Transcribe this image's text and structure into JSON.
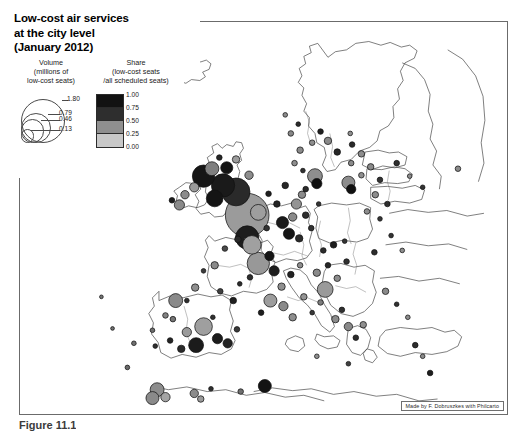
{
  "figure": {
    "caption": "Figure 11.1",
    "credit": "Made by F. Dobruszkes with Philcarto"
  },
  "title": {
    "line1": "Low-cost air services",
    "line2": "at the city level",
    "line3": "(January 2012)"
  },
  "legend": {
    "volume": {
      "head1": "Volume",
      "head2": "(millions of",
      "head3": "low-cost seats)",
      "values": [
        "1.80",
        "0.79",
        "0.46",
        "0.13"
      ]
    },
    "share": {
      "head1": "Share",
      "head2": "(low-cost seats",
      "head3": "/all scheduled seats)",
      "values": [
        "1.00",
        "0.75",
        "0.50",
        "0.25",
        "0.00"
      ],
      "colors": [
        "#121212",
        "#2e2e2e",
        "#8f8f8f",
        "#c8c8c8"
      ]
    }
  },
  "map": {
    "region": "Europe",
    "background": "#ffffff",
    "border_color": "#6b6b6b",
    "coastline_color": "#3a3a3a",
    "bubble_outline": "#111111",
    "bubbles": [
      {
        "x": 243,
        "y": 208,
        "r": 23.5,
        "fill": "#9b9b9b"
      },
      {
        "x": 231,
        "y": 183,
        "r": 15.0,
        "fill": "#2a2a2a"
      },
      {
        "x": 217,
        "y": 176,
        "r": 12.5,
        "fill": "#1a1a1a"
      },
      {
        "x": 208,
        "y": 190,
        "r": 9.0,
        "fill": "#141414"
      },
      {
        "x": 196,
        "y": 166,
        "r": 12.0,
        "fill": "#161616"
      },
      {
        "x": 205,
        "y": 158,
        "r": 7.5,
        "fill": "#7f7f7f"
      },
      {
        "x": 186,
        "y": 178,
        "r": 5.0,
        "fill": "#9a9a9a"
      },
      {
        "x": 176,
        "y": 186,
        "r": 4.5,
        "fill": "#8c8c8c"
      },
      {
        "x": 170,
        "y": 197,
        "r": 5.5,
        "fill": "#8a8a8a"
      },
      {
        "x": 162,
        "y": 192,
        "r": 3.0,
        "fill": "#1d1d1d"
      },
      {
        "x": 221,
        "y": 157,
        "r": 6.5,
        "fill": "#141414"
      },
      {
        "x": 231,
        "y": 148,
        "r": 4.0,
        "fill": "#9c9c9c"
      },
      {
        "x": 213,
        "y": 146,
        "r": 3.0,
        "fill": "#262626"
      },
      {
        "x": 245,
        "y": 165,
        "r": 4.5,
        "fill": "#8d8d8d"
      },
      {
        "x": 255,
        "y": 205,
        "r": 8.5,
        "fill": "#9e9e9e"
      },
      {
        "x": 243,
        "y": 232,
        "r": 12.5,
        "fill": "#1d1d1d"
      },
      {
        "x": 248,
        "y": 240,
        "r": 10.0,
        "fill": "#a0a0a0"
      },
      {
        "x": 233,
        "y": 234,
        "r": 3.5,
        "fill": "#2a2a2a"
      },
      {
        "x": 264,
        "y": 222,
        "r": 3.0,
        "fill": "#333333"
      },
      {
        "x": 219,
        "y": 244,
        "r": 3.0,
        "fill": "#4a4a4a"
      },
      {
        "x": 208,
        "y": 262,
        "r": 4.0,
        "fill": "#8b8b8b"
      },
      {
        "x": 196,
        "y": 268,
        "r": 2.5,
        "fill": "#3a3a3a"
      },
      {
        "x": 187,
        "y": 286,
        "r": 4.0,
        "fill": "#8f8f8f"
      },
      {
        "x": 178,
        "y": 300,
        "r": 2.5,
        "fill": "#2e2e2e"
      },
      {
        "x": 214,
        "y": 290,
        "r": 3.0,
        "fill": "#404040"
      },
      {
        "x": 228,
        "y": 300,
        "r": 3.5,
        "fill": "#1f1f1f"
      },
      {
        "x": 235,
        "y": 282,
        "r": 2.5,
        "fill": "#2b2b2b"
      },
      {
        "x": 206,
        "y": 318,
        "r": 2.5,
        "fill": "#303030"
      },
      {
        "x": 163,
        "y": 320,
        "r": 3.0,
        "fill": "#757575"
      },
      {
        "x": 141,
        "y": 332,
        "r": 2.5,
        "fill": "#6d6d6d"
      },
      {
        "x": 121,
        "y": 346,
        "r": 2.5,
        "fill": "#707070"
      },
      {
        "x": 166,
        "y": 300,
        "r": 7.5,
        "fill": "#8a8a8a"
      },
      {
        "x": 155,
        "y": 316,
        "r": 3.0,
        "fill": "#838383"
      },
      {
        "x": 178,
        "y": 334,
        "r": 5.0,
        "fill": "#9a9a9a"
      },
      {
        "x": 196,
        "y": 328,
        "r": 9.5,
        "fill": "#9f9f9f"
      },
      {
        "x": 188,
        "y": 348,
        "r": 8.0,
        "fill": "#1b1b1b"
      },
      {
        "x": 172,
        "y": 352,
        "r": 4.0,
        "fill": "#2a2a2a"
      },
      {
        "x": 160,
        "y": 343,
        "r": 3.0,
        "fill": "#242424"
      },
      {
        "x": 144,
        "y": 349,
        "r": 2.5,
        "fill": "#2e2e2e"
      },
      {
        "x": 211,
        "y": 341,
        "r": 5.5,
        "fill": "#1c1c1c"
      },
      {
        "x": 222,
        "y": 346,
        "r": 5.0,
        "fill": "#232323"
      },
      {
        "x": 232,
        "y": 331,
        "r": 3.0,
        "fill": "#3a3a3a"
      },
      {
        "x": 146,
        "y": 396,
        "r": 7.5,
        "fill": "#8d8d8d"
      },
      {
        "x": 141,
        "y": 405,
        "r": 7.0,
        "fill": "#8a8a8a"
      },
      {
        "x": 155,
        "y": 404,
        "r": 5.0,
        "fill": "#a4a4a4"
      },
      {
        "x": 186,
        "y": 400,
        "r": 4.5,
        "fill": "#8b8b8b"
      },
      {
        "x": 193,
        "y": 406,
        "r": 3.5,
        "fill": "#9a9a9a"
      },
      {
        "x": 204,
        "y": 395,
        "r": 2.5,
        "fill": "#2f2f2f"
      },
      {
        "x": 236,
        "y": 398,
        "r": 3.0,
        "fill": "#6f6f6f"
      },
      {
        "x": 262,
        "y": 392,
        "r": 7.0,
        "fill": "#131313"
      },
      {
        "x": 281,
        "y": 216,
        "r": 6.5,
        "fill": "#1a1a1a"
      },
      {
        "x": 292,
        "y": 210,
        "r": 4.5,
        "fill": "#8b8b8b"
      },
      {
        "x": 288,
        "y": 228,
        "r": 6.0,
        "fill": "#151515"
      },
      {
        "x": 299,
        "y": 233,
        "r": 4.0,
        "fill": "#2a2a2a"
      },
      {
        "x": 275,
        "y": 196,
        "r": 3.5,
        "fill": "#242424"
      },
      {
        "x": 296,
        "y": 196,
        "r": 5.5,
        "fill": "#949494"
      },
      {
        "x": 306,
        "y": 208,
        "r": 3.5,
        "fill": "#2e2e2e"
      },
      {
        "x": 312,
        "y": 222,
        "r": 3.0,
        "fill": "#313131"
      },
      {
        "x": 266,
        "y": 185,
        "r": 3.0,
        "fill": "#1f1f1f"
      },
      {
        "x": 284,
        "y": 176,
        "r": 3.5,
        "fill": "#272727"
      },
      {
        "x": 306,
        "y": 180,
        "r": 3.0,
        "fill": "#2c2c2c"
      },
      {
        "x": 320,
        "y": 196,
        "r": 2.5,
        "fill": "#343434"
      },
      {
        "x": 255,
        "y": 260,
        "r": 12.0,
        "fill": "#989898"
      },
      {
        "x": 267,
        "y": 252,
        "r": 5.0,
        "fill": "#151515"
      },
      {
        "x": 272,
        "y": 268,
        "r": 5.5,
        "fill": "#1e1e1e"
      },
      {
        "x": 246,
        "y": 275,
        "r": 3.0,
        "fill": "#2d2d2d"
      },
      {
        "x": 280,
        "y": 285,
        "r": 4.0,
        "fill": "#8f8f8f"
      },
      {
        "x": 290,
        "y": 272,
        "r": 3.5,
        "fill": "#222222"
      },
      {
        "x": 300,
        "y": 262,
        "r": 3.0,
        "fill": "#8d8d8d"
      },
      {
        "x": 268,
        "y": 300,
        "r": 7.0,
        "fill": "#9d9d9d"
      },
      {
        "x": 282,
        "y": 306,
        "r": 5.0,
        "fill": "#8b8b8b"
      },
      {
        "x": 258,
        "y": 313,
        "r": 3.0,
        "fill": "#1e1e1e"
      },
      {
        "x": 292,
        "y": 318,
        "r": 4.0,
        "fill": "#8e8e8e"
      },
      {
        "x": 304,
        "y": 296,
        "r": 3.5,
        "fill": "#949494"
      },
      {
        "x": 313,
        "y": 313,
        "r": 2.5,
        "fill": "#383838"
      },
      {
        "x": 322,
        "y": 302,
        "r": 3.0,
        "fill": "#7d7d7d"
      },
      {
        "x": 327,
        "y": 288,
        "r": 8.5,
        "fill": "#9a9a9a"
      },
      {
        "x": 338,
        "y": 320,
        "r": 4.0,
        "fill": "#8c8c8c"
      },
      {
        "x": 345,
        "y": 310,
        "r": 3.0,
        "fill": "#303030"
      },
      {
        "x": 352,
        "y": 328,
        "r": 4.5,
        "fill": "#898989"
      },
      {
        "x": 360,
        "y": 340,
        "r": 3.0,
        "fill": "#2c2c2c"
      },
      {
        "x": 368,
        "y": 326,
        "r": 3.5,
        "fill": "#8f8f8f"
      },
      {
        "x": 318,
        "y": 270,
        "r": 4.0,
        "fill": "#8a8a8a"
      },
      {
        "x": 330,
        "y": 262,
        "r": 3.0,
        "fill": "#262626"
      },
      {
        "x": 340,
        "y": 276,
        "r": 3.5,
        "fill": "#8d8d8d"
      },
      {
        "x": 350,
        "y": 258,
        "r": 3.0,
        "fill": "#303030"
      },
      {
        "x": 336,
        "y": 240,
        "r": 3.5,
        "fill": "#1d1d1d"
      },
      {
        "x": 325,
        "y": 246,
        "r": 3.0,
        "fill": "#2b2b2b"
      },
      {
        "x": 348,
        "y": 236,
        "r": 2.5,
        "fill": "#343434"
      },
      {
        "x": 316,
        "y": 166,
        "r": 8.0,
        "fill": "#8e8e8e"
      },
      {
        "x": 318,
        "y": 174,
        "r": 5.5,
        "fill": "#0f0f0f"
      },
      {
        "x": 302,
        "y": 186,
        "r": 4.0,
        "fill": "#8b8b8b"
      },
      {
        "x": 352,
        "y": 173,
        "r": 7.0,
        "fill": "#8d8d8d"
      },
      {
        "x": 355,
        "y": 180,
        "r": 5.0,
        "fill": "#101010"
      },
      {
        "x": 366,
        "y": 165,
        "r": 3.0,
        "fill": "#8f8f8f"
      },
      {
        "x": 376,
        "y": 156,
        "r": 3.5,
        "fill": "#8a8a8a"
      },
      {
        "x": 386,
        "y": 170,
        "r": 3.0,
        "fill": "#333333"
      },
      {
        "x": 381,
        "y": 186,
        "r": 3.5,
        "fill": "#8c8c8c"
      },
      {
        "x": 394,
        "y": 196,
        "r": 3.0,
        "fill": "#2e2e2e"
      },
      {
        "x": 372,
        "y": 204,
        "r": 3.0,
        "fill": "#8d8d8d"
      },
      {
        "x": 386,
        "y": 212,
        "r": 2.5,
        "fill": "#363636"
      },
      {
        "x": 355,
        "y": 152,
        "r": 3.0,
        "fill": "#8b8b8b"
      },
      {
        "x": 340,
        "y": 140,
        "r": 3.5,
        "fill": "#252525"
      },
      {
        "x": 330,
        "y": 128,
        "r": 4.0,
        "fill": "#8a8a8a"
      },
      {
        "x": 322,
        "y": 118,
        "r": 3.0,
        "fill": "#1f1f1f"
      },
      {
        "x": 313,
        "y": 130,
        "r": 3.0,
        "fill": "#8e8e8e"
      },
      {
        "x": 356,
        "y": 132,
        "r": 3.0,
        "fill": "#2a2a2a"
      },
      {
        "x": 366,
        "y": 142,
        "r": 3.5,
        "fill": "#8d8d8d"
      },
      {
        "x": 300,
        "y": 138,
        "r": 3.5,
        "fill": "#8b8b8b"
      },
      {
        "x": 294,
        "y": 152,
        "r": 3.0,
        "fill": "#8f8f8f"
      },
      {
        "x": 303,
        "y": 160,
        "r": 2.5,
        "fill": "#303030"
      },
      {
        "x": 290,
        "y": 120,
        "r": 3.0,
        "fill": "#888888"
      },
      {
        "x": 298,
        "y": 110,
        "r": 2.5,
        "fill": "#2b2b2b"
      },
      {
        "x": 284,
        "y": 100,
        "r": 2.5,
        "fill": "#8c8c8c"
      },
      {
        "x": 354,
        "y": 120,
        "r": 2.5,
        "fill": "#909090"
      },
      {
        "x": 404,
        "y": 152,
        "r": 3.0,
        "fill": "#2f2f2f"
      },
      {
        "x": 418,
        "y": 166,
        "r": 2.5,
        "fill": "#8d8d8d"
      },
      {
        "x": 432,
        "y": 178,
        "r": 2.5,
        "fill": "#333333"
      },
      {
        "x": 470,
        "y": 158,
        "r": 3.0,
        "fill": "#8b8b8b"
      },
      {
        "x": 398,
        "y": 230,
        "r": 2.5,
        "fill": "#343434"
      },
      {
        "x": 410,
        "y": 246,
        "r": 2.5,
        "fill": "#8e8e8e"
      },
      {
        "x": 380,
        "y": 248,
        "r": 3.0,
        "fill": "#2c2c2c"
      },
      {
        "x": 392,
        "y": 290,
        "r": 3.5,
        "fill": "#8a8a8a"
      },
      {
        "x": 404,
        "y": 304,
        "r": 2.5,
        "fill": "#303030"
      },
      {
        "x": 416,
        "y": 318,
        "r": 2.5,
        "fill": "#8d8d8d"
      },
      {
        "x": 424,
        "y": 348,
        "r": 3.0,
        "fill": "#2e2e2e"
      },
      {
        "x": 432,
        "y": 360,
        "r": 2.5,
        "fill": "#8b8b8b"
      },
      {
        "x": 440,
        "y": 378,
        "r": 3.0,
        "fill": "#1e1e1e"
      },
      {
        "x": 352,
        "y": 368,
        "r": 2.5,
        "fill": "#404040"
      },
      {
        "x": 318,
        "y": 360,
        "r": 2.5,
        "fill": "#8f8f8f"
      },
      {
        "x": 114,
        "y": 372,
        "r": 2.5,
        "fill": "#6a6a6a"
      },
      {
        "x": 98,
        "y": 330,
        "r": 2.0,
        "fill": "#707070"
      },
      {
        "x": 86,
        "y": 296,
        "r": 2.0,
        "fill": "#757575"
      }
    ]
  }
}
